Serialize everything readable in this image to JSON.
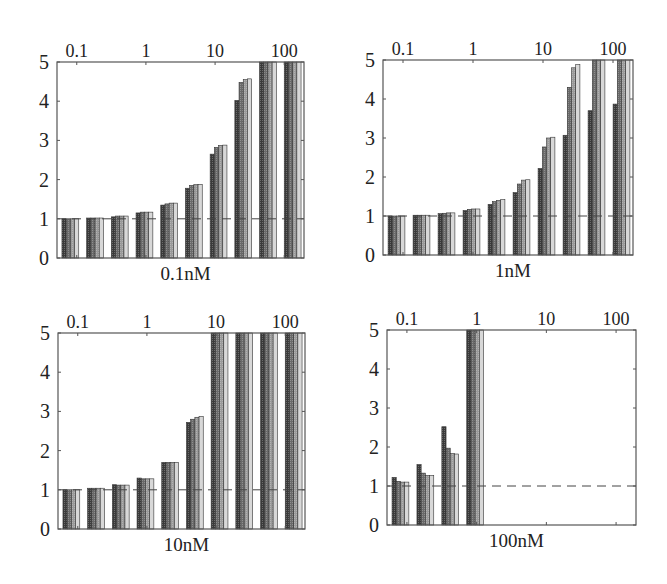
{
  "chart_data": [
    {
      "type": "bar",
      "title": "0.1nM",
      "xlabel": "0.1nM",
      "ylabel": "",
      "top_axis_ticks": [
        "0.1",
        "1",
        "10",
        "100"
      ],
      "y_ticks": [
        "0",
        "1",
        "2",
        "3",
        "4",
        "5"
      ],
      "ylim": [
        0,
        5
      ],
      "reference_line": 1,
      "group_count": 10,
      "bars_per_group": 4,
      "groups": [
        [
          1.0,
          1.0,
          1.0,
          1.0
        ],
        [
          1.02,
          1.02,
          1.02,
          1.02
        ],
        [
          1.05,
          1.07,
          1.07,
          1.07
        ],
        [
          1.15,
          1.17,
          1.17,
          1.17
        ],
        [
          1.35,
          1.38,
          1.4,
          1.4
        ],
        [
          1.78,
          1.85,
          1.87,
          1.88
        ],
        [
          2.65,
          2.82,
          2.87,
          2.88
        ],
        [
          4.02,
          4.48,
          4.55,
          4.57
        ],
        [
          5.0,
          5.0,
          5.0,
          5.0
        ],
        [
          5.0,
          5.0,
          5.0,
          5.0
        ]
      ],
      "grid": false
    },
    {
      "type": "bar",
      "title": "1nM",
      "xlabel": "1nM",
      "ylabel": "",
      "top_axis_ticks": [
        "0.1",
        "1",
        "10",
        "100"
      ],
      "y_ticks": [
        "0",
        "1",
        "2",
        "3",
        "4",
        "5"
      ],
      "ylim": [
        0,
        5
      ],
      "reference_line": 1,
      "group_count": 10,
      "bars_per_group": 4,
      "groups": [
        [
          1.0,
          1.0,
          1.0,
          1.0
        ],
        [
          1.02,
          1.02,
          1.02,
          1.02
        ],
        [
          1.06,
          1.07,
          1.08,
          1.08
        ],
        [
          1.14,
          1.17,
          1.18,
          1.18
        ],
        [
          1.3,
          1.37,
          1.4,
          1.42
        ],
        [
          1.6,
          1.82,
          1.92,
          1.93
        ],
        [
          2.22,
          2.77,
          3.0,
          3.02
        ],
        [
          3.07,
          4.3,
          4.8,
          4.88
        ],
        [
          3.7,
          5.0,
          5.0,
          5.0
        ],
        [
          3.87,
          5.0,
          5.0,
          5.0
        ]
      ],
      "grid": false
    },
    {
      "type": "bar",
      "title": "10nM",
      "xlabel": "10nM",
      "ylabel": "",
      "top_axis_ticks": [
        "0.1",
        "1",
        "10",
        "100"
      ],
      "y_ticks": [
        "0",
        "1",
        "2",
        "3",
        "4",
        "5"
      ],
      "ylim": [
        0,
        5
      ],
      "reference_line": 1,
      "group_count": 10,
      "bars_per_group": 4,
      "groups": [
        [
          1.0,
          1.0,
          1.0,
          1.0
        ],
        [
          1.04,
          1.04,
          1.04,
          1.04
        ],
        [
          1.13,
          1.12,
          1.12,
          1.12
        ],
        [
          1.3,
          1.28,
          1.28,
          1.28
        ],
        [
          1.7,
          1.7,
          1.7,
          1.7
        ],
        [
          2.72,
          2.8,
          2.85,
          2.87
        ],
        [
          5.0,
          5.0,
          5.0,
          5.0
        ],
        [
          5.0,
          5.0,
          5.0,
          5.0
        ],
        [
          5.0,
          5.0,
          5.0,
          5.0
        ],
        [
          5.0,
          5.0,
          5.0,
          5.0
        ]
      ],
      "grid": false
    },
    {
      "type": "bar",
      "title": "100nM",
      "xlabel": "100nM",
      "ylabel": "",
      "top_axis_ticks": [
        "0.1",
        "1",
        "10",
        "100"
      ],
      "y_ticks": [
        "0",
        "1",
        "2",
        "3",
        "4",
        "5"
      ],
      "ylim": [
        0,
        5
      ],
      "reference_line": 1,
      "group_count": 10,
      "bars_per_group": 4,
      "groups": [
        [
          1.22,
          1.12,
          1.1,
          1.1
        ],
        [
          1.55,
          1.33,
          1.27,
          1.27
        ],
        [
          2.52,
          1.97,
          1.83,
          1.82
        ],
        [
          5.0,
          5.0,
          5.0,
          5.0
        ],
        null,
        null,
        null,
        null,
        null,
        null
      ],
      "grid": false
    }
  ],
  "panels": [
    {
      "label": "0.1nM"
    },
    {
      "label": "1nM"
    },
    {
      "label": "10nM"
    },
    {
      "label": "100nM"
    }
  ],
  "axes": {
    "top_ticks": [
      "0.1",
      "1",
      "10",
      "100"
    ],
    "y_ticks": [
      "0",
      "1",
      "2",
      "3",
      "4",
      "5"
    ]
  },
  "colors": {
    "frame": "#555555",
    "bar_fills": [
      "#3a3a3a",
      "#6a6a6a",
      "#9a9a9a",
      "#d8d8d8"
    ],
    "bar_stroke": "#333333",
    "dashed_line": "#444444"
  }
}
